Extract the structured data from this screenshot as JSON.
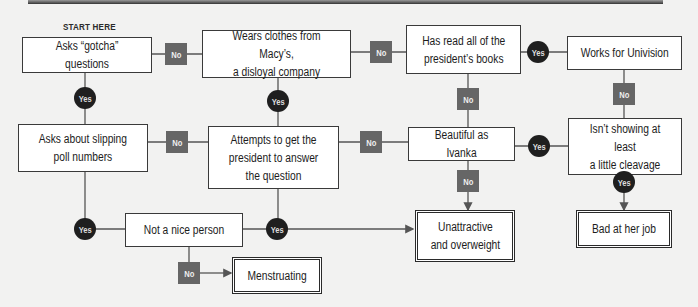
{
  "title": "START HERE",
  "nodes": {
    "gotcha": "Asks “gotcha” questions",
    "macys": "Wears clothes from Macy’s,\na disloyal company",
    "books": "Has read all of the\npresident’s books",
    "univision": "Works for Univision",
    "poll": "Asks about slipping\npoll numbers",
    "answer": "Attempts to get the\npresident to answer\nthe question",
    "ivanka": "Beautiful as Ivanka",
    "cleavage": "Isn’t showing at least\na little cleavage",
    "nice": "Not a nice person",
    "unattractive": "Unattractive\nand overweight",
    "badjob": "Bad at her job",
    "menstruating": "Menstruating"
  },
  "labels": {
    "yes": "Yes",
    "no": "No"
  },
  "colors": {
    "no_badge": "#666666",
    "yes_badge": "#1f1f1f",
    "line": "#555555",
    "background": "#f2f2f1"
  }
}
